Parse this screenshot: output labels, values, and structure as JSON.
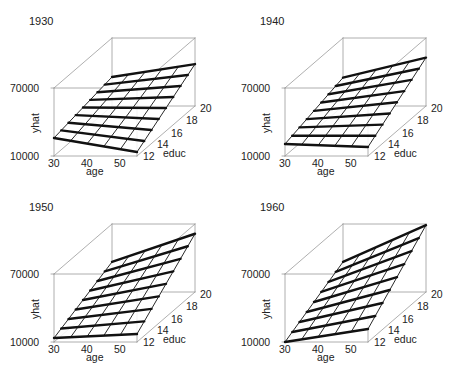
{
  "chart_data": [
    {
      "type": "surface3d",
      "title": "1930",
      "xlabel": "age",
      "ylabel": "educ",
      "zlabel": "yhat",
      "x_ticks": [
        "30",
        "40",
        "50"
      ],
      "y_ticks": [
        "12",
        "14",
        "16",
        "18",
        "20"
      ],
      "z_ticks": [
        "10000",
        "70000"
      ],
      "xlim": [
        30,
        55
      ],
      "ylim": [
        12,
        20
      ],
      "zlim": [
        10000,
        70000
      ],
      "corners": {
        "age30_educ12": 25900,
        "age55_educ12": 13500,
        "age30_educ20": 35600,
        "age55_educ20": 47000
      }
    },
    {
      "type": "surface3d",
      "title": "1940",
      "xlabel": "age",
      "ylabel": "educ",
      "zlabel": "yhat",
      "x_ticks": [
        "30",
        "40",
        "50"
      ],
      "y_ticks": [
        "12",
        "14",
        "16",
        "18",
        "20"
      ],
      "z_ticks": [
        "10000",
        "70000"
      ],
      "xlim": [
        30,
        55
      ],
      "ylim": [
        12,
        20
      ],
      "zlim": [
        10000,
        70000
      ],
      "corners": {
        "age30_educ12": 20600,
        "age55_educ12": 18000,
        "age30_educ20": 35000,
        "age55_educ20": 52700
      }
    },
    {
      "type": "surface3d",
      "title": "1950",
      "xlabel": "age",
      "ylabel": "educ",
      "zlabel": "yhat",
      "x_ticks": [
        "30",
        "40",
        "50"
      ],
      "y_ticks": [
        "12",
        "14",
        "16",
        "18",
        "20"
      ],
      "z_ticks": [
        "10000",
        "70000"
      ],
      "xlim": [
        30,
        55
      ],
      "ylim": [
        12,
        20
      ],
      "zlim": [
        10000,
        70000
      ],
      "corners": {
        "age30_educ12": 13500,
        "age55_educ12": 17100,
        "age30_educ20": 36500,
        "age55_educ20": 61400
      }
    },
    {
      "type": "surface3d",
      "title": "1960",
      "xlabel": "age",
      "ylabel": "educ",
      "zlabel": "yhat",
      "x_ticks": [
        "30",
        "40",
        "50"
      ],
      "y_ticks": [
        "12",
        "14",
        "16",
        "18",
        "20"
      ],
      "z_ticks": [
        "10000",
        "70000"
      ],
      "xlim": [
        30,
        55
      ],
      "ylim": [
        12,
        20
      ],
      "zlim": [
        10000,
        70000
      ],
      "corners": {
        "age30_educ12": 10000,
        "age55_educ12": 21500,
        "age30_educ20": 36500,
        "age55_educ20": 69000
      }
    }
  ],
  "style": {
    "box_color": "#9a9a9a",
    "grid_color": "#111111",
    "text_color": "#222222"
  },
  "grid": {
    "age_lines": 6,
    "educ_lines": 9
  }
}
